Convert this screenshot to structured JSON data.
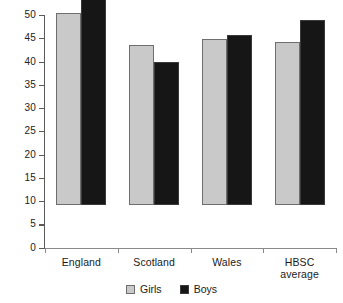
{
  "chart_data": {
    "type": "bar",
    "title": "",
    "subtitle": "",
    "xlabel": "",
    "ylabel": "",
    "categories": [
      "England",
      "Scotland",
      "Wales",
      "HBSC average"
    ],
    "category_lines": [
      [
        "England"
      ],
      [
        "Scotland"
      ],
      [
        "Wales"
      ],
      [
        "HBSC",
        "average"
      ]
    ],
    "series": [
      {
        "name": "Girls",
        "color": "#c9c9c9",
        "values": [
          41.2,
          34.5,
          35.7,
          35.0
        ]
      },
      {
        "name": "Boys",
        "color": "#161616",
        "values": [
          45.4,
          30.7,
          36.5,
          39.8
        ]
      }
    ],
    "ylim": [
      0,
      50
    ],
    "ytick_step": 5,
    "ytick_labels": [
      "50",
      "45",
      "40",
      "35",
      "30",
      "25",
      "20",
      "15",
      "10",
      "5",
      "0"
    ],
    "ytick_values": [
      50,
      45,
      40,
      35,
      30,
      25,
      20,
      15,
      10,
      5,
      0
    ],
    "grid": false,
    "legend_position": "bottom-center",
    "annotations": []
  },
  "legend": {
    "items": [
      {
        "label": "Girls",
        "color": "#c9c9c9"
      },
      {
        "label": "Boys",
        "color": "#161616"
      }
    ]
  },
  "colors": {
    "girls": "#c9c9c9",
    "boys": "#161616",
    "axis": "#5a5a5a",
    "text": "#1a1a1a",
    "background": "#ffffff"
  }
}
